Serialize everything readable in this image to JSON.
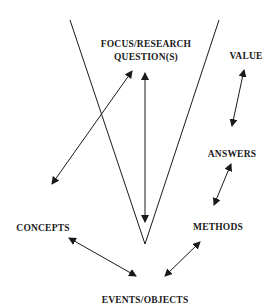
{
  "diagram": {
    "type": "vee-diagram",
    "colors": {
      "line": "#1a1a1a",
      "background": "#ffffff"
    },
    "nodes": {
      "focus_line1": "FOCUS/RESEARCH",
      "focus_line2": "QUESTION(S)",
      "value": "VALUE",
      "answers": "ANSWERS",
      "methods": "METHODS",
      "concepts": "CONCEPTS",
      "events": "EVENTS/OBJECTS"
    },
    "connections": [
      {
        "from": "CONCEPTS",
        "to": "FOCUS/RESEARCH QUESTION(S)",
        "style": "double-arrow"
      },
      {
        "from": "FOCUS/RESEARCH QUESTION(S)",
        "to": "EVENTS/OBJECTS",
        "style": "double-arrow"
      },
      {
        "from": "VALUE",
        "to": "ANSWERS",
        "style": "double-arrow"
      },
      {
        "from": "ANSWERS",
        "to": "METHODS",
        "style": "double-arrow"
      },
      {
        "from": "METHODS",
        "to": "EVENTS/OBJECTS",
        "style": "double-arrow"
      },
      {
        "from": "CONCEPTS",
        "to": "EVENTS/OBJECTS",
        "style": "double-arrow"
      }
    ]
  }
}
